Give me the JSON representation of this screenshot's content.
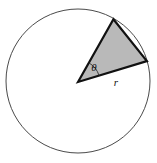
{
  "figure": {
    "type": "geometry-diagram",
    "width": 157,
    "height": 163,
    "background_color": "#ffffff"
  },
  "circle": {
    "name": "outer-circle",
    "center_x": 78,
    "center_y": 81,
    "radius": 72,
    "stroke_color": "#4a4a4a",
    "stroke_width": 1,
    "fill_color": "#ffffff"
  },
  "sector": {
    "name": "shaded-sector",
    "vertex_x": 78,
    "vertex_y": 82,
    "radius": 72,
    "start_angle_deg": -60.5,
    "end_angle_deg": -16.9,
    "sweep_deg": 43.6,
    "fill_color": "#b9b9b9",
    "stroke_color": "#111111",
    "stroke_width": 2.2,
    "arm_upper_x": 113,
    "arm_upper_y": 20,
    "arm_lower_x": 147,
    "arm_lower_y": 61
  },
  "angle_arc": {
    "name": "angle-arc-theta",
    "radius": 22,
    "stroke_color": "#2b2b2b",
    "stroke_width": 0.9
  },
  "labels": {
    "theta": {
      "text": "θ",
      "x": 94,
      "y": 71,
      "font_size": 11
    },
    "radius": {
      "text": "r",
      "x": 116,
      "y": 86,
      "font_size": 11
    }
  }
}
